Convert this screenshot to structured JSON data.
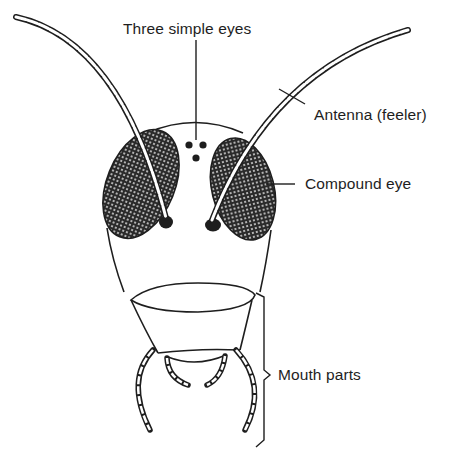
{
  "diagram": {
    "colors": {
      "ink": "#1e1e1e",
      "background": "#ffffff"
    },
    "labels": [
      {
        "id": "simple-eyes",
        "text": "Three simple eyes"
      },
      {
        "id": "antenna",
        "text": "Antenna (feeler)"
      },
      {
        "id": "compound-eye",
        "text": "Compound eye"
      },
      {
        "id": "mouth-parts",
        "text": "Mouth parts"
      }
    ]
  }
}
